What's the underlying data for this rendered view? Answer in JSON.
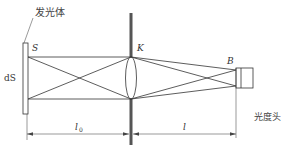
{
  "diagram": {
    "type": "optical-photometry-setup",
    "labels": {
      "source_name": "发光体",
      "source_point": "S",
      "source_element": "dS",
      "lens_point": "K",
      "detector_point": "B",
      "detector_name": "光度头",
      "dist_source_lens": "l",
      "dist_source_lens_sub": "0",
      "dist_lens_detector": "l"
    },
    "colors": {
      "line": "#333333",
      "aperture": "#555555",
      "background": "#ffffff"
    }
  }
}
